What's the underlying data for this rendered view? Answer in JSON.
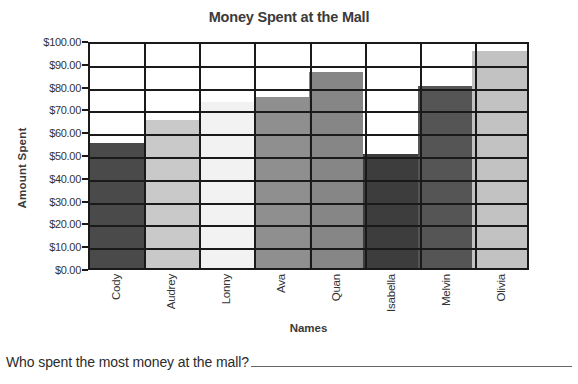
{
  "worksheet": {
    "question": "Who spent the most money at the mall?",
    "answer_value": ""
  },
  "chart_data": {
    "type": "bar",
    "title": "Money Spent at the Mall",
    "xlabel": "Names",
    "ylabel": "Amount Spent",
    "categories": [
      "Cody",
      "Audrey",
      "Lonny",
      "Ava",
      "Quan",
      "Isabella",
      "Melvin",
      "Olivia"
    ],
    "values": [
      55,
      65,
      73,
      75,
      86,
      50,
      80,
      95
    ],
    "bar_colors": [
      "#4a4a4a",
      "#c9c9c9",
      "#f2f2f2",
      "#8f8f8f",
      "#868686",
      "#3d3d3d",
      "#555555",
      "#c2c2c2"
    ],
    "ylim": [
      0,
      100
    ],
    "ytick_values": [
      100,
      90,
      80,
      70,
      60,
      50,
      40,
      30,
      20,
      10,
      0
    ],
    "ytick_labels": [
      "$100.00",
      "$90.00",
      "$80.00",
      "$70.00",
      "$60.00",
      "$50.00",
      "$40.00",
      "$30.00",
      "$20.00",
      "$10.00",
      "$0.00"
    ],
    "grid": true,
    "legend": "none",
    "axis_color": "#1a1a1a"
  }
}
